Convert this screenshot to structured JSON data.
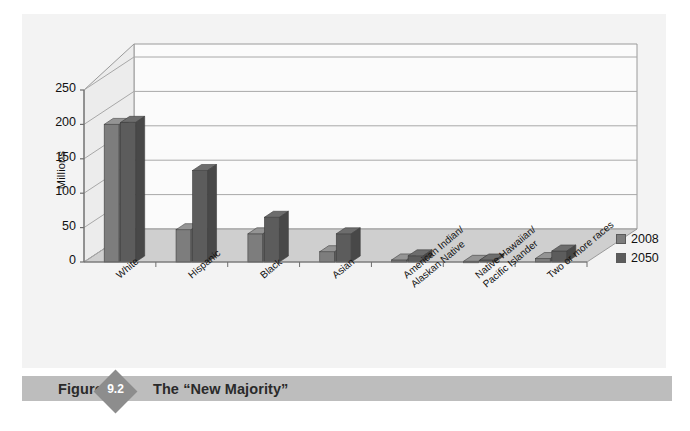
{
  "figure": {
    "label_word": "Figure",
    "number": "9.2",
    "title": "The “New Majority”"
  },
  "legend": {
    "items": [
      {
        "label": "2008",
        "color": "#7d7d7d"
      },
      {
        "label": "2050",
        "color": "#5c5c5c"
      }
    ]
  },
  "colors": {
    "chart_background": "#f3f3f3",
    "wall_background": "#fbfbfb",
    "floor": "#cfcfcf",
    "gridline": "#a8a8a8",
    "series_2008": "#7d7d7d",
    "series_2050": "#5c5c5c",
    "caption_band": "#bdbdbd",
    "badge": "#8d8d8d"
  },
  "chart_data": {
    "type": "bar",
    "title": "The “New Majority”",
    "xlabel": "",
    "ylabel": "Millions",
    "ylim": [
      0,
      250
    ],
    "yticks": [
      0,
      50,
      100,
      150,
      200,
      250
    ],
    "ytick_labels": [
      "0",
      "50",
      "100",
      "150",
      "200",
      "250"
    ],
    "grid": true,
    "legend_position": "right",
    "categories": [
      "White",
      "Hispanic",
      "Black",
      "Asian",
      "American Indian/\nAlaskan Native",
      "Native Hawaiian/\nPacific Islander",
      "Two or more races"
    ],
    "series": [
      {
        "name": "2008",
        "values": [
          200,
          47,
          41,
          15,
          3,
          1,
          5
        ]
      },
      {
        "name": "2050",
        "values": [
          203,
          133,
          65,
          41,
          9,
          3,
          16
        ]
      }
    ]
  }
}
